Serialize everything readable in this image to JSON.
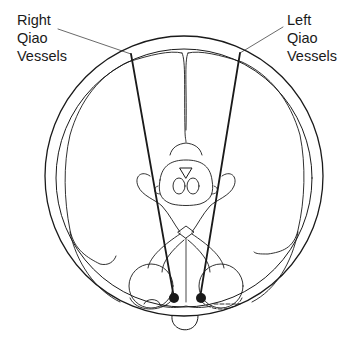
{
  "diagram": {
    "labels": {
      "right": {
        "lines": [
          "Right",
          "Qiao",
          "Vessels"
        ]
      },
      "left": {
        "lines": [
          "Left",
          "Qiao",
          "Vessels"
        ]
      }
    },
    "colors": {
      "stroke": "#1a1a1a",
      "fine_stroke": "#444444",
      "background": "#ffffff"
    },
    "vessels": [
      {
        "name": "right-qiao-vessel",
        "from": [
          131,
          54
        ],
        "to": [
          174,
          298
        ]
      },
      {
        "name": "left-qiao-vessel",
        "from": [
          240,
          53
        ],
        "to": [
          200,
          298
        ]
      }
    ],
    "endpoints": [
      {
        "name": "right-vessel-point",
        "cx": 174,
        "cy": 298
      },
      {
        "name": "left-vessel-point",
        "cx": 201,
        "cy": 298
      }
    ]
  }
}
